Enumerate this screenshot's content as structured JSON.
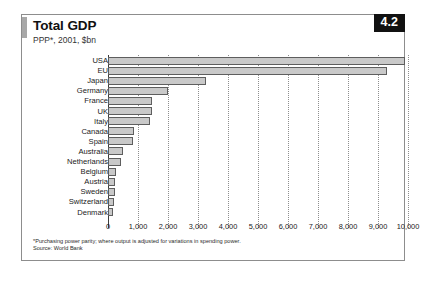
{
  "header": {
    "title": "Total GDP",
    "subtitle": "PPP*, 2001, $bn",
    "chapter_badge": "4.2"
  },
  "footnotes": {
    "note": "*Purchasing power parity; where output is adjusted for variations in spending power.",
    "source": "Source: World Bank"
  },
  "colors": {
    "bar_fill": "#c9c9c9",
    "bar_stroke": "#5e5e5e",
    "badge_bg": "#111111",
    "badge_text": "#ffffff",
    "card_border": "#8d8d8d",
    "gridline": "#8e8e8e",
    "axis": "#3c3c3c",
    "title_rule": "#a8a8a8"
  },
  "chart_data": {
    "type": "bar",
    "orientation": "horizontal",
    "title": "Total GDP",
    "subtitle": "PPP*, 2001, $bn",
    "xlabel": "",
    "ylabel": "",
    "xlim": [
      0,
      10000
    ],
    "xticks": [
      0,
      1000,
      2000,
      3000,
      4000,
      5000,
      6000,
      7000,
      8000,
      9000,
      10000
    ],
    "xticklabels": [
      "0",
      "1,000",
      "2,000",
      "3,000",
      "4,000",
      "5,000",
      "6,000",
      "7,000",
      "8,000",
      "9,000",
      "10,000"
    ],
    "grid": true,
    "grid_axis": "x",
    "legend": false,
    "units": "$bn",
    "categories": [
      "USA",
      "EU",
      "Japan",
      "Germany",
      "France",
      "UK",
      "Italy",
      "Canada",
      "Spain",
      "Australia",
      "Netherlands",
      "Belgium",
      "Austria",
      "Sweden",
      "Switzerland",
      "Denmark"
    ],
    "values": [
      9900,
      9300,
      3250,
      2000,
      1450,
      1450,
      1400,
      870,
      820,
      500,
      430,
      280,
      230,
      220,
      210,
      150
    ]
  }
}
